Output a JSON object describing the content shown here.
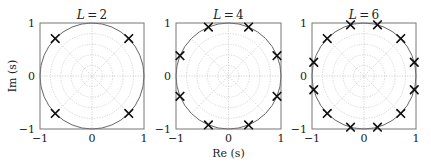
{
  "chart_data": [
    {
      "type": "scatter",
      "title": "L=2",
      "title_var": "L",
      "title_value": "2",
      "xlabel": "",
      "ylabel": "Im (s)",
      "xlim": [
        -1,
        1
      ],
      "ylim": [
        -1,
        1
      ],
      "xticks": [
        "−1",
        "0",
        "1"
      ],
      "yticks": [
        "1",
        "0",
        "−1"
      ],
      "grid": "polar (dotted concentric circles and radial lines)",
      "unit_circle": true,
      "marker": "x",
      "pole_angles_deg": [
        45,
        135,
        225,
        315
      ],
      "points": [
        {
          "re": 0.707,
          "im": 0.707
        },
        {
          "re": -0.707,
          "im": 0.707
        },
        {
          "re": -0.707,
          "im": -0.707
        },
        {
          "re": 0.707,
          "im": -0.707
        }
      ]
    },
    {
      "type": "scatter",
      "title": "L=4",
      "title_var": "L",
      "title_value": "4",
      "xlabel": "Re (s)",
      "ylabel": "",
      "xlim": [
        -1,
        1
      ],
      "ylim": [
        -1,
        1
      ],
      "xticks": [
        "−1",
        "0",
        "1"
      ],
      "yticks": [
        "1",
        "0",
        "−1"
      ],
      "grid": "polar (dotted concentric circles and radial lines)",
      "unit_circle": true,
      "marker": "x",
      "pole_angles_deg": [
        22.5,
        67.5,
        112.5,
        157.5,
        202.5,
        247.5,
        292.5,
        337.5
      ],
      "points": [
        {
          "re": 0.924,
          "im": 0.383
        },
        {
          "re": 0.383,
          "im": 0.924
        },
        {
          "re": -0.383,
          "im": 0.924
        },
        {
          "re": -0.924,
          "im": 0.383
        },
        {
          "re": -0.924,
          "im": -0.383
        },
        {
          "re": -0.383,
          "im": -0.924
        },
        {
          "re": 0.383,
          "im": -0.924
        },
        {
          "re": 0.924,
          "im": -0.383
        }
      ]
    },
    {
      "type": "scatter",
      "title": "L=6",
      "title_var": "L",
      "title_value": "6",
      "xlabel": "",
      "ylabel": "",
      "xlim": [
        -1,
        1
      ],
      "ylim": [
        -1,
        1
      ],
      "xticks": [
        "−1",
        "0",
        "1"
      ],
      "yticks": [
        "1",
        "0",
        "−1"
      ],
      "grid": "polar (dotted concentric circles and radial lines)",
      "unit_circle": true,
      "marker": "x",
      "pole_angles_deg": [
        15,
        45,
        75,
        105,
        135,
        165,
        195,
        225,
        255,
        285,
        315,
        345
      ],
      "points": [
        {
          "re": 0.966,
          "im": 0.259
        },
        {
          "re": 0.707,
          "im": 0.707
        },
        {
          "re": 0.259,
          "im": 0.966
        },
        {
          "re": -0.259,
          "im": 0.966
        },
        {
          "re": -0.707,
          "im": 0.707
        },
        {
          "re": -0.966,
          "im": 0.259
        },
        {
          "re": -0.966,
          "im": -0.259
        },
        {
          "re": -0.707,
          "im": -0.707
        },
        {
          "re": -0.259,
          "im": -0.966
        },
        {
          "re": 0.259,
          "im": -0.966
        },
        {
          "re": 0.707,
          "im": -0.707
        },
        {
          "re": 0.966,
          "im": -0.259
        }
      ]
    }
  ],
  "style": {
    "frame_color": "#777777",
    "unit_circle_color": "#666666",
    "grid_color": "#c8c8c8",
    "marker_color": "#111111"
  },
  "layout": {
    "panels": [
      {
        "left": 40,
        "top": 23,
        "right": 144,
        "bottom": 129
      },
      {
        "left": 176,
        "top": 23,
        "right": 281,
        "bottom": 129
      },
      {
        "left": 312,
        "top": 23,
        "right": 416,
        "bottom": 129
      }
    ]
  }
}
